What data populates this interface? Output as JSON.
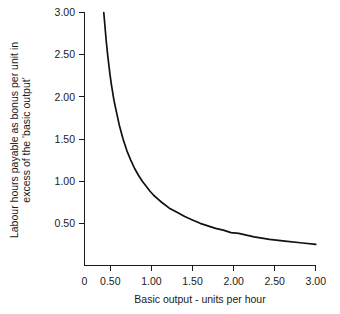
{
  "chart_data": {
    "type": "line",
    "title": "",
    "subtitle": "",
    "xlabel": "Basic output - units per hour",
    "ylabel_line1": "Labour hours payable as bonus per unit in",
    "ylabel_line2": "excess of the 'basic output'",
    "ylabel": "Labour hours payable as bonus per unit in excess of the 'basic output'",
    "xlim": [
      0,
      3.0
    ],
    "ylim": [
      0,
      3.0
    ],
    "xticks": [
      0,
      0.5,
      1.0,
      1.5,
      2.0,
      2.5,
      3.0
    ],
    "xticklabels": [
      "0",
      "0.50",
      "1.00",
      "1.50",
      "2.00",
      "2.50",
      "3.00"
    ],
    "yticks": [
      0.5,
      1.0,
      1.5,
      2.0,
      2.5,
      3.0
    ],
    "yticklabels": [
      "0.50",
      "1.00",
      "1.50",
      "2.00",
      "2.50",
      "3.00"
    ],
    "grid": false,
    "legend": null,
    "legend_position": "none",
    "curve_color": "#111111",
    "axis_color": "#1a1a1a",
    "background_color": "#ffffff",
    "relationship": "y = 0.75 / x",
    "series": [
      {
        "name": "Bonus hours per unit",
        "x": [
          0.25,
          0.28,
          0.3,
          0.33,
          0.35,
          0.38,
          0.4,
          0.45,
          0.5,
          0.55,
          0.6,
          0.65,
          0.7,
          0.75,
          0.8,
          0.85,
          0.9,
          0.95,
          1.0,
          1.1,
          1.2,
          1.3,
          1.4,
          1.5,
          1.6,
          1.7,
          1.8,
          1.9,
          2.0,
          2.2,
          2.4,
          2.6,
          2.8,
          3.0
        ],
        "y": [
          3.0,
          2.68,
          2.5,
          2.27,
          2.14,
          1.97,
          1.88,
          1.67,
          1.5,
          1.36,
          1.25,
          1.15,
          1.07,
          1.0,
          0.94,
          0.88,
          0.83,
          0.79,
          0.75,
          0.68,
          0.63,
          0.58,
          0.54,
          0.5,
          0.47,
          0.44,
          0.42,
          0.39,
          0.38,
          0.34,
          0.31,
          0.29,
          0.27,
          0.25
        ]
      }
    ],
    "annotations": []
  },
  "axes": {
    "x_axis_name": "x-axis",
    "y_axis_name": "y-axis"
  }
}
